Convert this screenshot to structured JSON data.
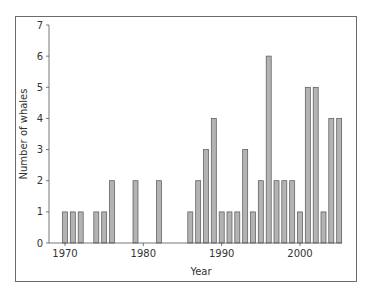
{
  "chart_data": {
    "type": "bar",
    "title": "",
    "xlabel": "Year",
    "ylabel": "Number of whales",
    "ylim": [
      0,
      7
    ],
    "xlim": [
      1967.9,
      2008
    ],
    "yticks": [
      0,
      1,
      2,
      3,
      4,
      5,
      6,
      7
    ],
    "xticks": [
      1970,
      1980,
      1990,
      2000
    ],
    "grid": false,
    "legend": null,
    "bar_color": "#b3b3b3",
    "bar_edge_color": "#555555",
    "categories": [
      1970,
      1971,
      1972,
      1974,
      1975,
      1976,
      1979,
      1982,
      1986,
      1987,
      1988,
      1989,
      1990,
      1991,
      1992,
      1993,
      1994,
      1995,
      1996,
      1997,
      1998,
      1999,
      2000,
      2001,
      2002,
      2003,
      2004,
      2005
    ],
    "values": [
      1,
      1,
      1,
      1,
      1,
      2,
      2,
      2,
      1,
      2,
      3,
      4,
      1,
      1,
      1,
      3,
      1,
      2,
      6,
      2,
      2,
      2,
      1,
      5,
      5,
      1,
      4,
      4
    ]
  }
}
